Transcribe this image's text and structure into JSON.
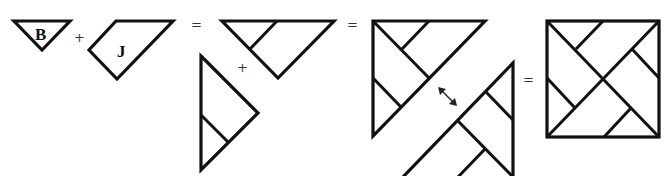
{
  "diagram": {
    "type": "tangram-composition",
    "stroke_color": "#111111",
    "background": "#ffffff",
    "pieces": [
      {
        "id": "piece-b",
        "label": "B",
        "shape": "triangle"
      },
      {
        "id": "piece-j",
        "label": "J",
        "shape": "parallelogram"
      }
    ],
    "operators": {
      "plus_1": "+",
      "equals_1": "=",
      "plus_2": "+",
      "equals_2": "=",
      "equals_3": "="
    },
    "steps": [
      {
        "id": "step-1",
        "description": "B + J"
      },
      {
        "id": "step-2",
        "description": "medium triangle + small composite triangle"
      },
      {
        "id": "step-3",
        "description": "large composite triangle, rotated copy (double arrow)"
      },
      {
        "id": "step-4",
        "description": "final square"
      }
    ],
    "swap_symbol": "double-arrow"
  }
}
